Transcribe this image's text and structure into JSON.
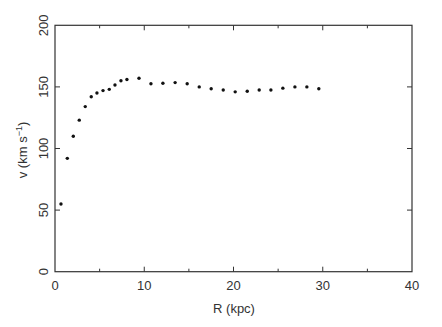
{
  "chart_data": {
    "type": "scatter",
    "title": "",
    "xlabel": "R (kpc)",
    "ylabel": "v (km s⁻¹)",
    "ylabel_parts": {
      "main": "v (km s",
      "sup": "−1",
      "close": ")"
    },
    "xlim": [
      0,
      40
    ],
    "ylim": [
      0,
      200
    ],
    "xticks": [
      0,
      10,
      20,
      30,
      40
    ],
    "xminor_ticks": [
      5,
      15,
      25,
      35
    ],
    "yticks": [
      0,
      50,
      100,
      150,
      200
    ],
    "grid": false,
    "legend": null,
    "marker_color": "#111111",
    "axis_color": "#333333",
    "series": [
      {
        "name": "rotation curve",
        "x": [
          0.67,
          1.38,
          2.05,
          2.72,
          3.39,
          4.06,
          4.7,
          5.38,
          6.08,
          6.72,
          7.39,
          8.06,
          9.41,
          10.75,
          12.09,
          13.46,
          14.81,
          16.16,
          17.5,
          18.85,
          20.19,
          21.54,
          22.88,
          24.19,
          25.53,
          26.88,
          28.22,
          29.56
        ],
        "y": [
          55,
          92,
          110,
          123,
          134,
          142,
          145,
          147,
          148,
          151.5,
          155,
          156,
          157,
          152.5,
          153,
          153.5,
          152.5,
          150,
          148.5,
          147.5,
          146,
          146.5,
          147.5,
          147.5,
          149,
          150,
          150,
          148.5
        ]
      }
    ]
  }
}
